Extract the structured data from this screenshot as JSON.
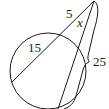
{
  "diagram": {
    "type": "circle-two-secants",
    "labels": {
      "secant1_external": "5",
      "secant1_internal": "15",
      "secant2_external": "x",
      "secant2_whole": "25"
    },
    "colors": {
      "line": "#1a1a1a",
      "background": "#ffffff"
    }
  }
}
